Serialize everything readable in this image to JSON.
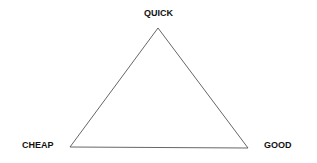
{
  "diagram": {
    "type": "triangle",
    "stroke_color": "#555555",
    "vertices": {
      "top": {
        "label": "QUICK",
        "x": 158,
        "y": 28
      },
      "bottom_left": {
        "label": "CHEAP",
        "x": 70,
        "y": 147
      },
      "bottom_right": {
        "label": "GOOD",
        "x": 248,
        "y": 148
      }
    }
  }
}
